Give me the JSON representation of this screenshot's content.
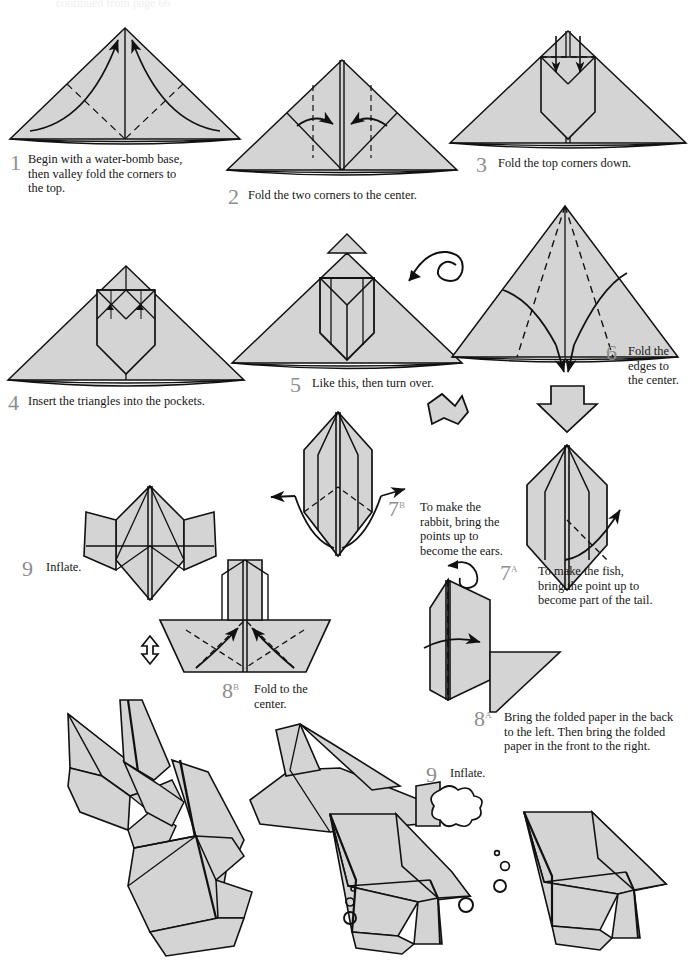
{
  "page": {
    "top_note": "continued from page 66",
    "paper_fill": "#d4d4d4",
    "line_color": "#111111",
    "number_color": "#8e8e8e",
    "background": "#ffffff",
    "width": 700,
    "height": 961
  },
  "steps": [
    {
      "id": "step-1",
      "number": "1",
      "sup": "",
      "caption": "Begin with a water-bomb base, then valley fold the corners to the top.",
      "lines": [
        "Begin with a water-bomb base,",
        "then valley fold the corners to",
        "the top."
      ]
    },
    {
      "id": "step-2",
      "number": "2",
      "sup": "",
      "caption": "Fold the two corners to the center.",
      "lines": [
        "Fold the two corners to the center."
      ]
    },
    {
      "id": "step-3",
      "number": "3",
      "sup": "",
      "caption": "Fold the top corners down.",
      "lines": [
        "Fold the top corners down."
      ]
    },
    {
      "id": "step-4",
      "number": "4",
      "sup": "",
      "caption": "Insert the triangles into the pockets.",
      "lines": [
        "Insert the triangles into the pockets."
      ]
    },
    {
      "id": "step-5",
      "number": "5",
      "sup": "",
      "caption": "Like this, then turn over.",
      "lines": [
        "Like this, then turn over."
      ]
    },
    {
      "id": "step-6",
      "number": "6",
      "sup": "",
      "caption": "Fold the edges to the center.",
      "lines": [
        "Fold the",
        "edges to",
        "the center."
      ]
    },
    {
      "id": "step-7b",
      "number": "7",
      "sup": "B",
      "caption": "To make the rabbit, bring the points up to become the ears.",
      "lines": [
        "To make the",
        "rabbit, bring the",
        "points up to",
        "become the ears."
      ]
    },
    {
      "id": "step-7a",
      "number": "7",
      "sup": "A",
      "caption": "To make the fish, bring the point up to become part of the tail.",
      "lines": [
        "To make the fish,",
        "bring the point up to",
        "become part of the tail."
      ]
    },
    {
      "id": "step-8b",
      "number": "8",
      "sup": "B",
      "caption": "Fold to the center.",
      "lines": [
        "Fold to the",
        "center."
      ]
    },
    {
      "id": "step-8a",
      "number": "8",
      "sup": "A",
      "caption": "Bring the folded paper in the back to the left. Then bring the folded paper in the front to the right.",
      "lines": [
        "Bring the folded paper in the back",
        "to the left. Then bring the folded",
        "paper in the front to the right."
      ]
    },
    {
      "id": "step-9b",
      "number": "9",
      "sup": "",
      "caption": "Inflate.",
      "lines": [
        "Inflate."
      ]
    },
    {
      "id": "step-9a",
      "number": "9",
      "sup": "",
      "caption": "Inflate.",
      "lines": [
        "Inflate."
      ]
    }
  ],
  "models": [
    {
      "id": "finished-rabbit",
      "label": "rabbit"
    },
    {
      "id": "finished-fish-left",
      "label": "fish"
    },
    {
      "id": "finished-fish-right",
      "label": "fish"
    }
  ],
  "symbols": [
    {
      "id": "turn-over-arrow",
      "label": "turn over loop arrow"
    },
    {
      "id": "block-arrow-down",
      "label": "proceed arrow"
    },
    {
      "id": "inflate-arrow-up",
      "label": "inflate puff arrow"
    },
    {
      "id": "inflate-puff-right",
      "label": "inflate puff arrow"
    },
    {
      "id": "valley-fold-dashed",
      "label": "valley fold line"
    },
    {
      "id": "fold-direction-arrow",
      "label": "fold direction arrow"
    },
    {
      "id": "bubbles",
      "label": "water bubbles"
    }
  ]
}
